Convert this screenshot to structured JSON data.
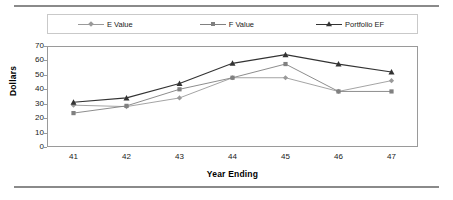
{
  "chart_data": {
    "type": "line",
    "title": "",
    "xlabel": "Year Ending",
    "ylabel": "Dollars",
    "categories": [
      "41",
      "42",
      "43",
      "44",
      "45",
      "46",
      "47"
    ],
    "x": [
      41,
      42,
      43,
      44,
      45,
      46,
      47
    ],
    "xlim": [
      40.5,
      47.5
    ],
    "ylim": [
      0,
      70
    ],
    "yticks": [
      70,
      60,
      50,
      40,
      30,
      20,
      10,
      0
    ],
    "grid": false,
    "legend_position": "top",
    "series": [
      {
        "name": "E Value",
        "marker": "diamond",
        "color": "#9a9a9a",
        "values": [
          29,
          28,
          34,
          48,
          48,
          38.5,
          46
        ]
      },
      {
        "name": "F Value",
        "marker": "square",
        "color": "#808080",
        "values": [
          23.5,
          28.5,
          40,
          48,
          57.5,
          38.5,
          38.5
        ]
      },
      {
        "name": "Portfolio EF",
        "marker": "triangle",
        "color": "#333333",
        "values": [
          31,
          34,
          44,
          58,
          64,
          57.5,
          52
        ]
      }
    ]
  },
  "legend": {
    "items": [
      {
        "label": "E Value"
      },
      {
        "label": "F Value"
      },
      {
        "label": "Portfolio EF"
      }
    ]
  },
  "axes": {
    "y_label": "Dollars",
    "x_label": "Year Ending",
    "y_ticks": [
      "70",
      "60",
      "50",
      "40",
      "30",
      "20",
      "10",
      "0"
    ],
    "x_ticks": [
      "41",
      "42",
      "43",
      "44",
      "45",
      "46",
      "47"
    ]
  },
  "colors": {
    "series_e": "#9a9a9a",
    "series_f": "#808080",
    "series_portfolio": "#333333",
    "frame": "#9a9a9a",
    "rule": "#8a8a8a"
  }
}
